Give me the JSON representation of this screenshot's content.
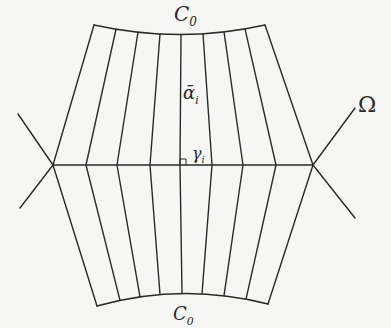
{
  "labels": {
    "top_curve": {
      "base": "C",
      "sub": "0"
    },
    "bottom_curve": {
      "base": "C",
      "sub": "0"
    },
    "vertical_segment": {
      "base": "ᾱ",
      "sub": "i"
    },
    "horizontal_segment": {
      "base": "γ",
      "sub": "i"
    },
    "region": "Ω"
  },
  "colors": {
    "ink": "#2a2a2a",
    "paper": "#f6f6f4"
  },
  "geometry": {
    "top_curve": {
      "start": [
        94,
        25
      ],
      "control": [
        180,
        44
      ],
      "end": [
        265,
        25
      ]
    },
    "bottom_curve": {
      "start": [
        97,
        306
      ],
      "control": [
        182,
        282
      ],
      "end": [
        268,
        304
      ]
    },
    "middle_line": {
      "start": [
        53,
        165
      ],
      "end": [
        313,
        165
      ]
    },
    "left_vertex": [
      53,
      165
    ],
    "right_vertex": [
      313,
      165
    ],
    "left_whiskers": [
      [
        18,
        114
      ],
      [
        20,
        208
      ]
    ],
    "right_whiskers": [
      [
        355,
        108
      ],
      [
        355,
        218
      ]
    ],
    "top_x": [
      94,
      116,
      138,
      160,
      181,
      203,
      224,
      245,
      265
    ],
    "mid_x": [
      53,
      86,
      117,
      150,
      180,
      212,
      243,
      276,
      313
    ],
    "bottom_x": [
      97,
      120,
      140,
      160,
      182,
      202,
      224,
      246,
      268
    ]
  }
}
